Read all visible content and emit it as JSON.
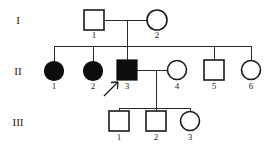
{
  "figure": {
    "type": "pedigree-chart",
    "width": 279,
    "height": 150,
    "background_color": "#ffffff",
    "line_color": "#2b2b2b",
    "affected_fill_color": "#0d0d0d",
    "unaffected_fill_color": "#ffffff",
    "symbol_stroke_color": "#1a1a1a"
  },
  "generations": [
    {
      "id": "gen-1",
      "label": "I",
      "label_x": 18,
      "label_y": 24,
      "y": 20
    },
    {
      "id": "gen-2",
      "label": "II",
      "label_x": 18,
      "label_y": 75,
      "y": 71
    },
    {
      "id": "gen-3",
      "label": "III",
      "label_x": 18,
      "label_y": 126,
      "y": 122
    }
  ],
  "individuals": [
    {
      "id": "I-1",
      "generation": "I",
      "label": "1",
      "sex": "male",
      "shape": "square",
      "affected": true,
      "filled": false,
      "cx": 94,
      "cy": 20,
      "size": 20,
      "label_x": 94,
      "label_y": 38
    },
    {
      "id": "I-2",
      "generation": "I",
      "label": "2",
      "sex": "female",
      "shape": "circle",
      "affected": false,
      "filled": false,
      "cx": 157,
      "cy": 20,
      "size": 20,
      "label_x": 157,
      "label_y": 38
    },
    {
      "id": "II-1",
      "generation": "II",
      "label": "1",
      "sex": "female",
      "shape": "circle",
      "affected": true,
      "filled": true,
      "cx": 54,
      "cy": 71,
      "size": 19,
      "label_x": 54,
      "label_y": 89
    },
    {
      "id": "II-2",
      "generation": "II",
      "label": "2",
      "sex": "female",
      "shape": "circle",
      "affected": true,
      "filled": true,
      "cx": 93,
      "cy": 71,
      "size": 19,
      "label_x": 93,
      "label_y": 89
    },
    {
      "id": "II-3",
      "generation": "II",
      "label": "3",
      "sex": "male",
      "shape": "square",
      "affected": true,
      "filled": true,
      "cx": 127,
      "cy": 70,
      "size": 20,
      "label_x": 127,
      "label_y": 89
    },
    {
      "id": "II-4",
      "generation": "II",
      "label": "4",
      "sex": "female",
      "shape": "circle",
      "affected": false,
      "filled": false,
      "cx": 177,
      "cy": 70,
      "size": 19,
      "label_x": 177,
      "label_y": 89
    },
    {
      "id": "II-5",
      "generation": "II",
      "label": "5",
      "sex": "male",
      "shape": "square",
      "affected": false,
      "filled": false,
      "cx": 214,
      "cy": 70,
      "size": 20,
      "label_x": 214,
      "label_y": 89
    },
    {
      "id": "II-6",
      "generation": "II",
      "label": "6",
      "sex": "female",
      "shape": "circle",
      "affected": false,
      "filled": false,
      "cx": 251,
      "cy": 70,
      "size": 19,
      "label_x": 251,
      "label_y": 89
    },
    {
      "id": "III-1",
      "generation": "III",
      "label": "1",
      "sex": "male",
      "shape": "square",
      "affected": false,
      "filled": false,
      "cx": 119,
      "cy": 121,
      "size": 20,
      "label_x": 119,
      "label_y": 140
    },
    {
      "id": "III-2",
      "generation": "III",
      "label": "2",
      "sex": "male",
      "shape": "square",
      "affected": false,
      "filled": false,
      "cx": 156,
      "cy": 121,
      "size": 20,
      "label_x": 156,
      "label_y": 140
    },
    {
      "id": "III-3",
      "generation": "III",
      "label": "3",
      "sex": "female",
      "shape": "circle",
      "affected": false,
      "filled": false,
      "cx": 190,
      "cy": 121,
      "size": 19,
      "label_x": 190,
      "label_y": 140
    }
  ],
  "matings": [
    {
      "id": "mating-I",
      "partner_a": "I-1",
      "partner_b": "I-2",
      "line_y": 20,
      "x_start": 104,
      "x_end": 147,
      "descent_x": 127,
      "descent_y_end": 46
    },
    {
      "id": "mating-II",
      "partner_a": "II-3",
      "partner_b": "II-4",
      "line_y": 70,
      "x_start": 137,
      "x_end": 167,
      "descent_x": 156,
      "descent_y_end": 108
    }
  ],
  "sibship_lines": [
    {
      "id": "sibship-gen-2",
      "y": 46,
      "x_start": 54,
      "x_end": 251,
      "drop_xs": [
        54,
        93,
        127,
        214,
        251
      ],
      "drop_y_end": 61
    },
    {
      "id": "sibship-gen-3",
      "y": 108,
      "x_start": 119,
      "x_end": 190,
      "drop_xs": [
        119,
        156,
        190
      ],
      "drop_y_end": 111
    }
  ],
  "proband": {
    "id": "proband-arrow",
    "points_to": "II-3",
    "x1": 104,
    "y1": 96,
    "x2": 118,
    "y2": 82,
    "head_a_x": 111,
    "head_a_y": 82,
    "head_b_x": 118,
    "head_b_y": 89
  },
  "legend": {
    "filled_meaning": "affected",
    "open_meaning": "unaffected",
    "square_meaning": "male",
    "circle_meaning": "female",
    "arrow_meaning": "proband"
  }
}
